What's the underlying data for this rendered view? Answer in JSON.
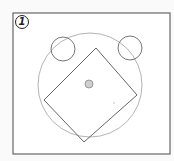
{
  "figure": {
    "label": "1",
    "colors": {
      "background": "#fafafa",
      "panel": "#ffffff",
      "frame": "#666666",
      "big_circle": "#aaaaaa",
      "small_circles": "#777777",
      "square": "#666666",
      "center_dot_fill": "#cfcfcf",
      "center_dot_stroke": "#888888"
    },
    "frame": {
      "x": 13,
      "y": 13,
      "width": 157,
      "height": 141
    },
    "big_circle": {
      "cx": 90,
      "cy": 85,
      "r": 52
    },
    "small_circles": [
      {
        "name": "left",
        "cx": 63,
        "cy": 49,
        "r": 12
      },
      {
        "name": "right",
        "cx": 130,
        "cy": 48,
        "r": 12
      }
    ],
    "square": {
      "points": "96,48 137,95 84,142 44,100"
    },
    "center_dot": {
      "cx": 89,
      "cy": 84,
      "r": 4
    },
    "speck": {
      "cx": 114,
      "cy": 103,
      "r": 0.8
    }
  }
}
